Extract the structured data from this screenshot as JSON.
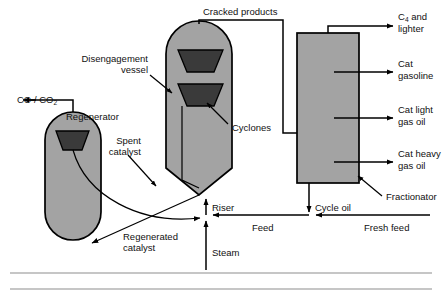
{
  "diagram": {
    "colors": {
      "vessel_fill": "#a3a3a3",
      "cyclone_fill": "#3a3a3a",
      "line": "#000000",
      "background": "#ffffff",
      "rule": "#8d8d8d"
    },
    "equipment": [
      {
        "id": "regenerator",
        "label": "Regenerator"
      },
      {
        "id": "disengagement-vessel",
        "label": "Disengagement\nvessel",
        "line1": "Disengagement",
        "line2": "vessel"
      },
      {
        "id": "cyclones",
        "label": "Cyclones"
      },
      {
        "id": "fractionator",
        "label": "Fractionator"
      }
    ],
    "labels": {
      "co_co2_main": "CO / CO",
      "co_co2_sub": "2",
      "regenerator": "Regenerator",
      "disengagement_line1": "Disengagement",
      "disengagement_line2": "vessel",
      "spent_line1": "Spent",
      "spent_line2": "catalyst",
      "cyclones": "Cyclones",
      "cracked_products": "Cracked products",
      "c4_main": "C",
      "c4_sub": "4",
      "c4_rest": " and",
      "c4_line2": "lighter",
      "cat_gasoline_line1": "Cat",
      "cat_gasoline_line2": "gasoline",
      "cat_light_line1": "Cat light",
      "cat_light_line2": "gas oil",
      "cat_heavy_line1": "Cat heavy",
      "cat_heavy_line2": "gas oil",
      "fractionator": "Fractionator",
      "riser": "Riser",
      "cycle_oil": "Cycle oil",
      "feed": "Feed",
      "fresh_feed": "Fresh feed",
      "steam": "Steam",
      "regenerated_line1": "Regenerated",
      "regenerated_line2": "catalyst"
    },
    "streams": [
      {
        "id": "co-co2-outlet",
        "label": "CO / CO2",
        "direction": "left",
        "from": "regenerator"
      },
      {
        "id": "cracked-products",
        "label": "Cracked products",
        "from": "disengagement-vessel",
        "to": "fractionator"
      },
      {
        "id": "c4-and-lighter",
        "label": "C4 and lighter",
        "from": "fractionator",
        "direction": "right"
      },
      {
        "id": "cat-gasoline",
        "label": "Cat gasoline",
        "from": "fractionator",
        "direction": "right"
      },
      {
        "id": "cat-light-gas-oil",
        "label": "Cat light gas oil",
        "from": "fractionator",
        "direction": "right"
      },
      {
        "id": "cat-heavy-gas-oil",
        "label": "Cat heavy gas oil",
        "from": "fractionator",
        "direction": "right"
      },
      {
        "id": "cycle-oil",
        "label": "Cycle oil",
        "from": "fractionator",
        "direction": "down"
      },
      {
        "id": "fresh-feed",
        "label": "Fresh feed",
        "direction": "left"
      },
      {
        "id": "feed",
        "label": "Feed",
        "direction": "left",
        "to": "riser"
      },
      {
        "id": "steam",
        "label": "Steam",
        "direction": "up",
        "to": "riser"
      },
      {
        "id": "riser",
        "label": "Riser",
        "direction": "up",
        "to": "disengagement-vessel"
      },
      {
        "id": "spent-catalyst",
        "label": "Spent catalyst",
        "from": "disengagement-vessel",
        "to": "regenerator"
      },
      {
        "id": "regenerated-catalyst",
        "label": "Regenerated catalyst",
        "from": "regenerator",
        "to": "riser"
      }
    ]
  }
}
